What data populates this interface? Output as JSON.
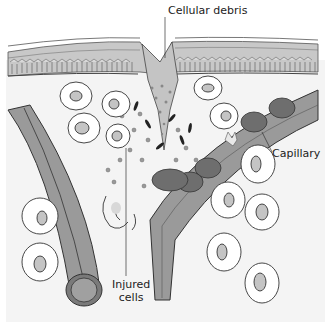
{
  "diagram": {
    "type": "anatomical-illustration",
    "labels": {
      "cellular_debris": "Cellular debris",
      "capillary": "Capillary",
      "injured_cells_line1": "Injured",
      "injured_cells_line2": "cells"
    },
    "colors": {
      "background": "#ffffff",
      "tissue_fill": "#f4f4f4",
      "epidermis_fill": "#c8c8c8",
      "epidermis_line": "#555555",
      "vessel_fill": "#9a9a9a",
      "vessel_dark": "#6e6e6e",
      "red_cell_fill": "#707070",
      "nucleus_fill": "#c4c4c4",
      "debris_fill": "#b8b8b8",
      "outline": "#333333"
    }
  }
}
